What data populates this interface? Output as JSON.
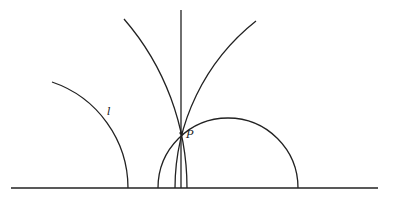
{
  "diagram": {
    "labels": {
      "point": "P",
      "line": "l"
    },
    "stroke_color": "#222222",
    "background": "#ffffff"
  }
}
